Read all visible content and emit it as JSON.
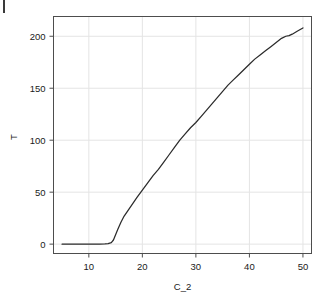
{
  "figure": {
    "background_color": "#ffffff",
    "frame_color": "#4d4d4d",
    "grid_color": "#e4e4e4",
    "line_color": "#2b2b2b",
    "text_color": "#1a1a1a",
    "crop_mark": "page-crop-mark"
  },
  "chart_data": {
    "type": "line",
    "title": "",
    "subtitle": "",
    "xlabel": "C_2",
    "ylabel": "T",
    "xlim": [
      3.4,
      51.6
    ],
    "ylim": [
      -9,
      219
    ],
    "xticks": [
      10,
      20,
      30,
      40,
      50
    ],
    "xtick_labels": [
      "10",
      "20",
      "30",
      "40",
      "50"
    ],
    "yticks": [
      0,
      50,
      100,
      150,
      200
    ],
    "ytick_labels": [
      "0",
      "50",
      "100",
      "150",
      "200"
    ],
    "grid": true,
    "grid_axis": "both",
    "legend": null,
    "legend_position": "none",
    "annotations": [],
    "series": [
      {
        "name": "T",
        "x": [
          5.0,
          6.0,
          7.0,
          8.0,
          9.0,
          10.0,
          11.0,
          12.0,
          13.0,
          13.6,
          14.2,
          14.6,
          15.0,
          15.4,
          16.0,
          16.6,
          17.4,
          18.2,
          19.0,
          20.0,
          21.0,
          22.0,
          23.0,
          24.0,
          25.0,
          26.0,
          27.0,
          28.0,
          29.0,
          30.0,
          31.0,
          32.0,
          33.0,
          34.0,
          35.0,
          36.0,
          37.0,
          38.0,
          39.0,
          40.0,
          41.0,
          42.0,
          43.0,
          44.0,
          45.0,
          46.0,
          46.8,
          47.4,
          48.0,
          49.0,
          50.0
        ],
        "y": [
          0.0,
          0.0,
          0.0,
          0.0,
          0.0,
          0.0,
          0.0,
          0.0,
          0.2,
          0.5,
          1.5,
          4.0,
          9.0,
          14.0,
          21.0,
          27.0,
          33.0,
          39.0,
          45.0,
          52.0,
          59.0,
          66.0,
          72.0,
          79.0,
          86.0,
          93.0,
          100.0,
          106.0,
          112.0,
          117.0,
          123.0,
          129.0,
          135.0,
          141.0,
          147.0,
          153.0,
          158.0,
          163.0,
          168.0,
          173.0,
          178.0,
          182.0,
          186.0,
          190.0,
          194.0,
          198.0,
          200.0,
          200.6,
          202.0,
          205.0,
          208.0
        ]
      }
    ]
  }
}
